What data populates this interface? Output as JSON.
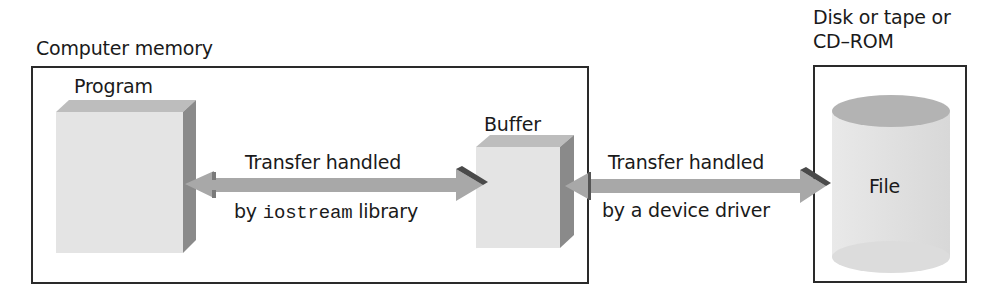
{
  "diagram": {
    "memory_region": {
      "label": "Computer memory"
    },
    "storage_region": {
      "label_line1": "Disk or tape or",
      "label_line2": "CD–ROM"
    },
    "nodes": {
      "program": {
        "label": "Program",
        "shape": "3d-block"
      },
      "buffer": {
        "label": "Buffer",
        "shape": "3d-block"
      },
      "file": {
        "label": "File",
        "shape": "cylinder"
      }
    },
    "edges": [
      {
        "from": "program",
        "to": "buffer",
        "direction": "bidirectional",
        "label_top": "Transfer handled",
        "label_bottom_prefix": "by ",
        "label_bottom_code": "iostream",
        "label_bottom_suffix": " library"
      },
      {
        "from": "buffer",
        "to": "file",
        "direction": "bidirectional",
        "label_top": "Transfer handled",
        "label_bottom": "by a device driver"
      }
    ],
    "colors": {
      "block_front": "#e4e4e4",
      "block_top": "#bdbdbd",
      "block_side": "#8a8a8a",
      "arrow": "#a8a8a8",
      "arrow_dark": "#4a4a4a",
      "border": "#2a2a2a",
      "text": "#1a1a1a"
    }
  }
}
